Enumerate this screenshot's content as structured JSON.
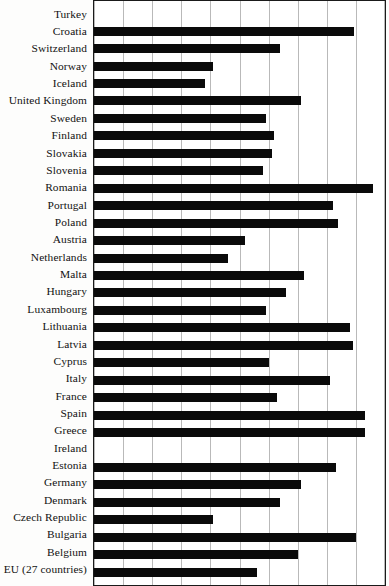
{
  "chart_data": {
    "type": "bar",
    "orientation": "horizontal",
    "title": "",
    "subtitle": "",
    "xlabel": "",
    "ylabel": "",
    "xlim": [
      0,
      10
    ],
    "xticks": [
      0,
      1,
      2,
      3,
      4,
      5,
      6,
      7,
      8,
      9,
      10
    ],
    "xtick_labels": [
      "",
      "",
      "",
      "",
      "",
      "",
      "",
      "",
      "",
      "",
      ""
    ],
    "grid": true,
    "grid_axis": "x",
    "legend": false,
    "legend_position": "none",
    "bar_color": "#0a0a0a",
    "plot_background": "#ffffff",
    "categories": [
      "Turkey",
      "Croatia",
      "Switzerland",
      "Norway",
      "Iceland",
      "United Kingdom",
      "Sweden",
      "Finland",
      "Slovakia",
      "Slovenia",
      "Romania",
      "Portugal",
      "Poland",
      "Austria",
      "Netherlands",
      "Malta",
      "Hungary",
      "Luxambourg",
      "Lithuania",
      "Latvia",
      "Cyprus",
      "Italy",
      "France",
      "Spain",
      "Greece",
      "Ireland",
      "Estonia",
      "Germany",
      "Denmark",
      "Czech Republic",
      "Bulgaria",
      "Belgium",
      "EU (27 countries)"
    ],
    "values": [
      0.0,
      8.95,
      6.4,
      4.1,
      3.8,
      7.1,
      5.9,
      6.2,
      6.1,
      5.8,
      9.6,
      8.2,
      8.4,
      5.2,
      4.6,
      7.2,
      6.6,
      5.9,
      8.8,
      8.9,
      6.0,
      8.1,
      6.3,
      9.3,
      9.3,
      0.0,
      8.3,
      7.1,
      6.4,
      4.1,
      9.0,
      7.0,
      5.6
    ]
  },
  "axis": {
    "gridline_count": 11
  }
}
